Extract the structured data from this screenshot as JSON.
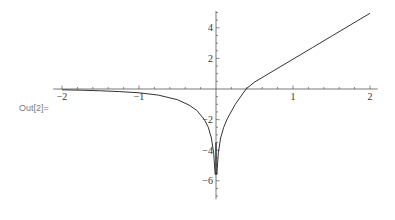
{
  "cell": {
    "out_label": "Out[2]="
  },
  "chart_data": {
    "type": "line",
    "title": "",
    "xlabel": "",
    "ylabel": "",
    "xlim": [
      -2.05,
      2.1
    ],
    "ylim": [
      -7.2,
      5.1
    ],
    "grid": false,
    "legend": null,
    "x_ticks": [
      -2,
      -1,
      1,
      2
    ],
    "y_ticks": [
      4,
      2,
      -2,
      -4,
      -6
    ],
    "x_tick_labels": [
      "-2",
      "-1",
      "1",
      "2"
    ],
    "y_tick_labels": [
      "4",
      "2",
      "-2",
      "-4",
      "-6"
    ],
    "series": [
      {
        "name": "left-branch",
        "x": [
          -2.0,
          -1.75,
          -1.5,
          -1.25,
          -1.0,
          -0.75,
          -0.5,
          -0.35,
          -0.25,
          -0.15,
          -0.1,
          -0.06,
          -0.03,
          -0.01
        ],
        "y": [
          -0.05,
          -0.08,
          -0.12,
          -0.17,
          -0.25,
          -0.4,
          -0.7,
          -1.05,
          -1.4,
          -2.0,
          -2.5,
          -3.2,
          -4.2,
          -5.6
        ]
      },
      {
        "name": "right-branch",
        "x": [
          0.01,
          0.03,
          0.06,
          0.1,
          0.15,
          0.25,
          0.39,
          0.5,
          0.75,
          1.0,
          1.25,
          1.5,
          1.75,
          2.0
        ],
        "y": [
          -5.6,
          -4.2,
          -3.2,
          -2.5,
          -1.9,
          -1.0,
          0.0,
          0.45,
          1.2,
          1.95,
          2.7,
          3.45,
          4.2,
          4.95
        ]
      }
    ]
  }
}
